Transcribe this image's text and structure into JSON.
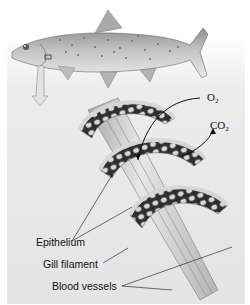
{
  "figure": {
    "labels": {
      "o2": "O",
      "o2_sub": "2",
      "co2": "CO",
      "co2_sub": "2",
      "epithelium": "Epithelium",
      "gill_filament": "Gill filament",
      "blood_vessels": "Blood vessels"
    },
    "colors": {
      "background_panel": "#e6e6e6",
      "fish_body": "#b9b9b9",
      "filament": "#cfcfcf",
      "lamella_mesh": "#3a3a3a",
      "arrow": "#111111"
    }
  }
}
